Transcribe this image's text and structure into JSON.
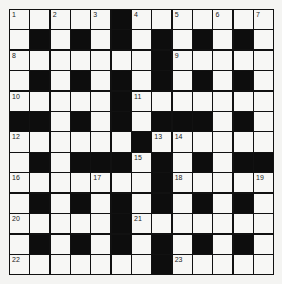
{
  "puzzle": {
    "rows": 13,
    "cols": 13,
    "layout": [
      "11111011111111",
      "1010101010101",
      "1111111011111",
      "1010101010101",
      "1111101111111",
      "0010101000101",
      "1111110111111",
      "1010001010100",
      "1111111011111",
      "1010101010101",
      "1111101111111",
      "1010101010101",
      "1111111011111"
    ],
    "grid": [
      [
        1,
        1,
        1,
        1,
        1,
        0,
        1,
        1,
        1,
        1,
        1,
        1,
        1
      ],
      [
        1,
        0,
        1,
        0,
        1,
        0,
        1,
        0,
        1,
        0,
        1,
        0,
        1
      ],
      [
        1,
        1,
        1,
        1,
        1,
        1,
        1,
        0,
        1,
        1,
        1,
        1,
        1
      ],
      [
        1,
        0,
        1,
        0,
        1,
        0,
        1,
        0,
        1,
        0,
        1,
        0,
        1
      ],
      [
        1,
        1,
        1,
        1,
        1,
        0,
        1,
        1,
        1,
        1,
        1,
        1,
        1
      ],
      [
        0,
        0,
        1,
        0,
        1,
        0,
        1,
        0,
        0,
        0,
        1,
        0,
        1
      ],
      [
        1,
        1,
        1,
        1,
        1,
        1,
        0,
        1,
        1,
        1,
        1,
        1,
        1
      ],
      [
        1,
        0,
        1,
        0,
        0,
        0,
        1,
        0,
        1,
        0,
        1,
        0,
        0
      ],
      [
        1,
        1,
        1,
        1,
        1,
        1,
        1,
        0,
        1,
        1,
        1,
        1,
        1
      ],
      [
        1,
        0,
        1,
        0,
        1,
        0,
        1,
        0,
        1,
        0,
        1,
        0,
        1
      ],
      [
        1,
        1,
        1,
        1,
        1,
        0,
        1,
        1,
        1,
        1,
        1,
        1,
        1
      ],
      [
        1,
        0,
        1,
        0,
        1,
        0,
        1,
        0,
        1,
        0,
        1,
        0,
        1
      ],
      [
        1,
        1,
        1,
        1,
        1,
        1,
        1,
        0,
        1,
        1,
        1,
        1,
        1
      ]
    ],
    "numbers": [
      {
        "r": 0,
        "c": 0,
        "n": "1"
      },
      {
        "r": 0,
        "c": 2,
        "n": "2"
      },
      {
        "r": 0,
        "c": 4,
        "n": "3"
      },
      {
        "r": 0,
        "c": 6,
        "n": "4"
      },
      {
        "r": 0,
        "c": 8,
        "n": "5"
      },
      {
        "r": 0,
        "c": 10,
        "n": "6"
      },
      {
        "r": 0,
        "c": 12,
        "n": "7"
      },
      {
        "r": 2,
        "c": 0,
        "n": "8"
      },
      {
        "r": 2,
        "c": 8,
        "n": "9"
      },
      {
        "r": 4,
        "c": 0,
        "n": "10"
      },
      {
        "r": 4,
        "c": 6,
        "n": "11"
      },
      {
        "r": 6,
        "c": 0,
        "n": "12"
      },
      {
        "r": 6,
        "c": 7,
        "n": "13"
      },
      {
        "r": 6,
        "c": 8,
        "n": "14"
      },
      {
        "r": 7,
        "c": 6,
        "n": "15"
      },
      {
        "r": 8,
        "c": 0,
        "n": "16"
      },
      {
        "r": 8,
        "c": 4,
        "n": "17"
      },
      {
        "r": 8,
        "c": 8,
        "n": "18"
      },
      {
        "r": 8,
        "c": 12,
        "n": "19"
      },
      {
        "r": 10,
        "c": 0,
        "n": "20"
      },
      {
        "r": 10,
        "c": 6,
        "n": "21"
      },
      {
        "r": 12,
        "c": 0,
        "n": "22"
      },
      {
        "r": 12,
        "c": 8,
        "n": "23"
      }
    ],
    "colors": {
      "block": "#0d0d0d",
      "cell": "#f7f7f5",
      "background": "#f4f4f2"
    }
  }
}
